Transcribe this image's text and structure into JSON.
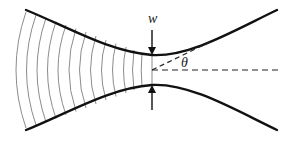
{
  "diagram": {
    "labels": {
      "waist": "w",
      "angle": "θ"
    },
    "colors": {
      "beam_edge": "#111111",
      "wavefront": "#8c8c8c",
      "dashed": "#222222",
      "background": "#ffffff"
    },
    "elements": {
      "beam_edges": 2,
      "wavefront_arcs": 14,
      "axis_line": "dashed horizontal",
      "asymptote_line": "dashed diagonal",
      "arrows": [
        "down arrow to waist (top)",
        "up arrow to waist (bottom)"
      ]
    }
  }
}
